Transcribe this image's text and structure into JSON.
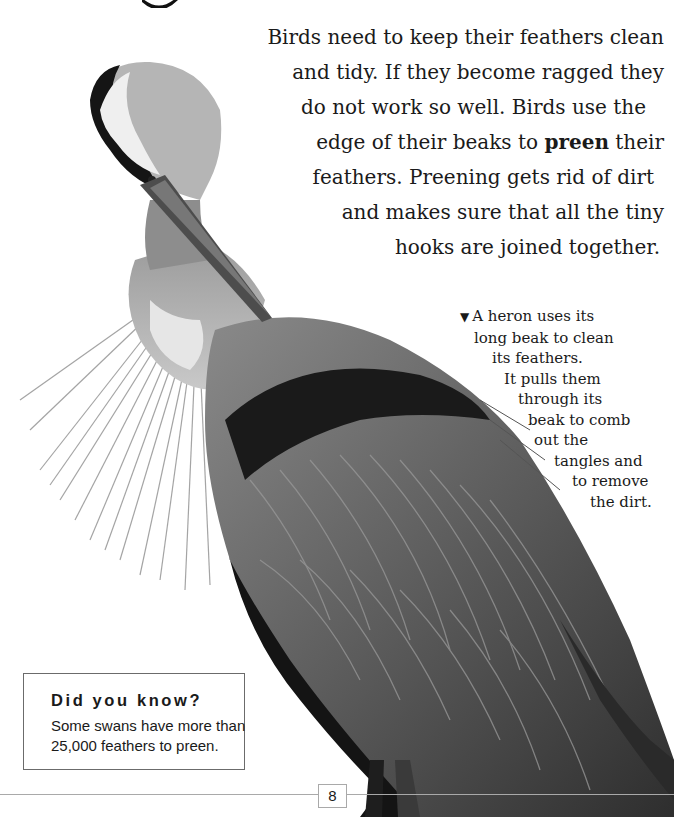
{
  "page": {
    "number": "8",
    "heading_fragment_visible": true
  },
  "body": {
    "lines": [
      "Birds need to keep their feathers clean",
      "and tidy. If they become ragged they",
      "do not work so well. Birds use the",
      "edge of their beaks to ",
      "their",
      "feathers. Preening gets rid of dirt",
      "and makes sure that all the tiny",
      "hooks are joined together."
    ],
    "bold_term": "preen"
  },
  "caption": {
    "marker": "▼",
    "lines": [
      "A heron uses its",
      "long beak to clean",
      "its feathers.",
      "It pulls them",
      "through its",
      "beak to comb",
      "out the",
      "tangles and",
      "to remove",
      "the dirt."
    ]
  },
  "fact_box": {
    "title": "Did you know?",
    "lines": [
      "Some swans have more than",
      "25,000 feathers to preen."
    ]
  },
  "image": {
    "subject": "grey heron preening",
    "style": "black-and-white photo"
  },
  "colors": {
    "text": "#1a1a1a",
    "rule": "#a9a9a9",
    "box_border": "#6b6b6b",
    "background": "#ffffff"
  }
}
